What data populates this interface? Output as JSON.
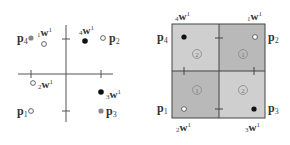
{
  "colors": {
    "axis": "#555555",
    "quadrant_dark": "#b8b8b8",
    "quadrant_light": "#cfcfcf",
    "border": "#444444",
    "filled_point": "#111111",
    "gray_point": "#888888",
    "open_point_fill": "#ffffff",
    "open_point_stroke": "#555555"
  },
  "left_plot": {
    "points": [
      {
        "id": "p4",
        "label": "p",
        "sub": "4",
        "kind": "gray"
      },
      {
        "id": "p2",
        "label": "p",
        "sub": "2",
        "kind": "open"
      },
      {
        "id": "p1",
        "label": "p",
        "sub": "1",
        "kind": "open"
      },
      {
        "id": "p3",
        "label": "p",
        "sub": "3",
        "kind": "gray"
      }
    ],
    "weights": [
      {
        "id": "1w1",
        "pre": "1",
        "label": "w",
        "sup": "1",
        "kind": "open"
      },
      {
        "id": "4w1",
        "pre": "4",
        "label": "w",
        "sup": "1",
        "kind": "filled"
      },
      {
        "id": "2w1",
        "pre": "2",
        "label": "w",
        "sup": "1",
        "kind": "open"
      },
      {
        "id": "3w1",
        "pre": "3",
        "label": "w",
        "sup": "1",
        "kind": "filled"
      }
    ]
  },
  "right_plot": {
    "quadrants": [
      {
        "position": "top-left",
        "region": "2",
        "shade": "light"
      },
      {
        "position": "top-right",
        "region": "1",
        "shade": "dark"
      },
      {
        "position": "bottom-left",
        "region": "1",
        "shade": "dark"
      },
      {
        "position": "bottom-right",
        "region": "2",
        "shade": "light"
      }
    ],
    "points": [
      {
        "id": "p4",
        "label": "p",
        "sub": "4"
      },
      {
        "id": "p2",
        "label": "p",
        "sub": "2"
      },
      {
        "id": "p1",
        "label": "p",
        "sub": "1"
      },
      {
        "id": "p3",
        "label": "p",
        "sub": "3"
      }
    ],
    "weights": [
      {
        "id": "4w1",
        "pre": "4",
        "label": "w",
        "sup": "1",
        "kind": "filled"
      },
      {
        "id": "1w1",
        "pre": "1",
        "label": "w",
        "sup": "1",
        "kind": "open"
      },
      {
        "id": "2w1",
        "pre": "2",
        "label": "w",
        "sup": "1",
        "kind": "open"
      },
      {
        "id": "3w1",
        "pre": "3",
        "label": "w",
        "sup": "1",
        "kind": "filled"
      }
    ]
  }
}
